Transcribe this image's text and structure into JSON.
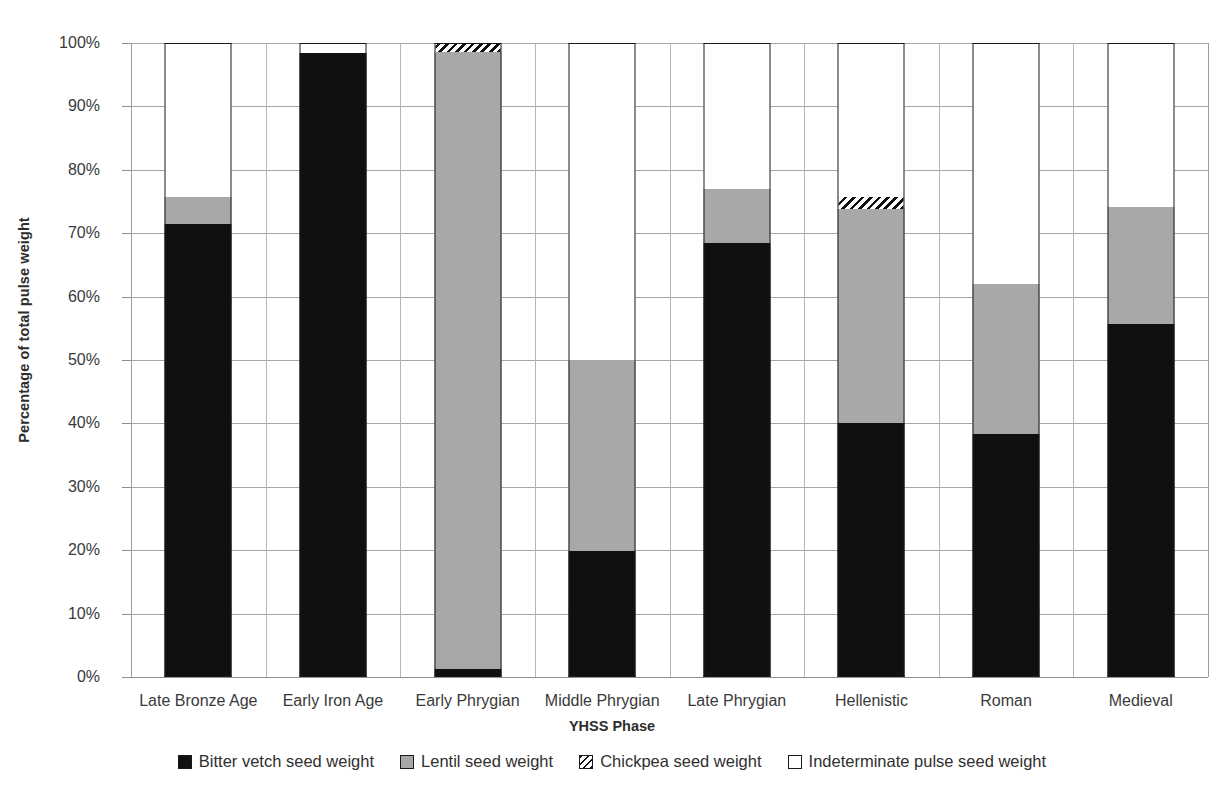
{
  "chart_data": {
    "type": "bar",
    "subtype": "stacked-percent",
    "title": "",
    "xlabel": "YHSS Phase",
    "ylabel": "Percentage of total pulse weight",
    "ylim": [
      0,
      100
    ],
    "yticks": [
      0,
      10,
      20,
      30,
      40,
      50,
      60,
      70,
      80,
      90,
      100
    ],
    "ytick_labels": [
      "0%",
      "10%",
      "20%",
      "30%",
      "40%",
      "50%",
      "60%",
      "70%",
      "80%",
      "90%",
      "100%"
    ],
    "grid": true,
    "legend_position": "bottom",
    "categories": [
      "Late Bronze Age",
      "Early Iron Age",
      "Early Phrygian",
      "Middle Phrygian",
      "Late Phrygian",
      "Hellenistic",
      "Roman",
      "Medieval"
    ],
    "series": [
      {
        "name": "Bitter vetch seed weight",
        "key": "bittervetch",
        "color": "#101010",
        "pattern": "solid",
        "values": [
          71.5,
          98.4,
          1.2,
          19.9,
          68.4,
          40.0,
          38.3,
          55.7
        ]
      },
      {
        "name": "Lentil seed weight",
        "key": "lentil",
        "color": "#a8a8a8",
        "pattern": "solid",
        "values": [
          4.2,
          0.0,
          97.4,
          30.1,
          8.6,
          33.8,
          23.7,
          18.5
        ]
      },
      {
        "name": "Chickpea seed weight",
        "key": "chickpea",
        "color": "#ffffff",
        "pattern": "diagonal-hatch",
        "values": [
          0.0,
          0.0,
          1.4,
          0.0,
          0.0,
          1.9,
          0.0,
          0.0
        ]
      },
      {
        "name": "Indeterminate pulse seed weight",
        "key": "indet",
        "color": "#ffffff",
        "pattern": "solid",
        "values": [
          24.3,
          1.6,
          0.0,
          50.0,
          23.0,
          24.3,
          38.0,
          25.8
        ]
      }
    ]
  },
  "axes": {
    "y_title": "Percentage of total pulse weight",
    "x_title": "YHSS Phase"
  },
  "legend": {
    "items": [
      {
        "label": "Bitter vetch seed weight",
        "swatch": "bittervetch-swatch-icon"
      },
      {
        "label": "Lentil seed weight",
        "swatch": "lentil-swatch-icon"
      },
      {
        "label": "Chickpea seed weight",
        "swatch": "chickpea-swatch-icon"
      },
      {
        "label": "Indeterminate pulse seed weight",
        "swatch": "indeterminate-swatch-icon"
      }
    ]
  },
  "colors": {
    "bitter_vetch": "#101010",
    "lentil": "#a8a8a8",
    "chickpea_hatch": "#111111",
    "indeterminate": "#ffffff",
    "gridline": "#a6a6a6",
    "text": "#3a3a3a"
  }
}
